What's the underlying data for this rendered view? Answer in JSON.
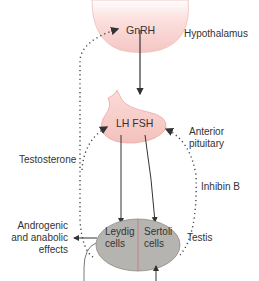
{
  "diagram": {
    "nodes": {
      "hypothalamus": {
        "label": "Hypothalamus",
        "hormone": "GnRH"
      },
      "pituitary": {
        "label_line1": "Anterior",
        "label_line2": "pituitary",
        "hormones": "LH FSH"
      },
      "testis": {
        "label": "Testis",
        "cell_left_line1": "Leydig",
        "cell_left_line2": "cells",
        "cell_right_line1": "Sertoli",
        "cell_right_line2": "cells"
      }
    },
    "feedback": {
      "testosterone": "Testosterone",
      "inhibin": "Inhibin B"
    },
    "effects": {
      "line1": "Androgenic",
      "line2": "and anabolic",
      "line3": "effects"
    },
    "colors": {
      "gland_fill": "#f6c9c6",
      "gland_stroke": "#e8a9a4",
      "testis_fill": "#b5b3b0",
      "testis_stroke": "#8a8886",
      "divider": "#c9737a",
      "arrow": "#333333"
    }
  }
}
